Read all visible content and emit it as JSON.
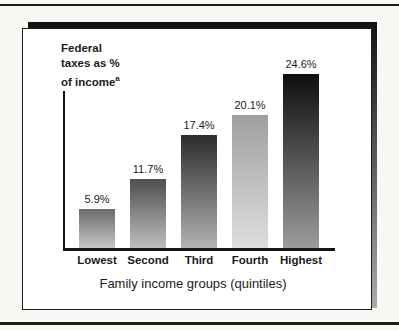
{
  "figure": {
    "y_axis_label": {
      "line1": "Federal",
      "line2": "taxes as %",
      "line3": "of income",
      "superscript": "a"
    }
  },
  "chart_data": {
    "type": "bar",
    "categories": [
      "Lowest",
      "Second",
      "Third",
      "Fourth",
      "Highest"
    ],
    "values": [
      5.9,
      11.7,
      17.4,
      20.1,
      24.6
    ],
    "value_labels": [
      "5.9%",
      "11.7%",
      "17.4%",
      "20.1%",
      "24.6%"
    ],
    "title": "",
    "xlabel": "Family income groups (quintiles)",
    "ylabel": "Federal taxes as % of income",
    "ylabel_footnote_marker": "a",
    "ylim": [
      0,
      26
    ],
    "grid": false,
    "legend": "none",
    "bar_heights_px": [
      39,
      69,
      113,
      133,
      174
    ],
    "bar_styles": [
      {
        "top": "#6b6b6b",
        "bottom": "#c6c6c6"
      },
      {
        "top": "#4f4f4f",
        "bottom": "#bdbdbd"
      },
      {
        "top": "#2c2c2c",
        "bottom": "#b3b3b3"
      },
      {
        "top": "#9f9f9f",
        "bottom": "#dedede"
      },
      {
        "top": "#0e0e0e",
        "bottom": "#9c9c9c"
      }
    ],
    "ink_color": "#1b1b1b"
  }
}
